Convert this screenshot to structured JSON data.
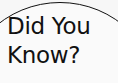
{
  "bubble": {
    "line1": "Did You",
    "line2": "Know?",
    "fill_color": "#fafafa",
    "outline_color": "#111111"
  }
}
